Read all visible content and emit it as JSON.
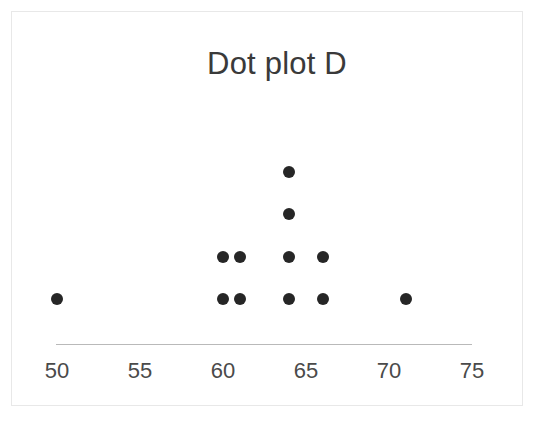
{
  "chart_data": {
    "type": "scatter",
    "plot_style": "dot-plot",
    "title": "Dot plot D",
    "xlabel": "",
    "ylabel": "",
    "xlim": [
      48.5,
      76.5
    ],
    "grid": false,
    "legend": null,
    "axis_line_color": "#b9b9b9",
    "dot_color": "#262626",
    "tick_labels": [
      "50",
      "55",
      "60",
      "65",
      "70",
      "75"
    ],
    "tick_values": [
      50,
      55,
      60,
      65,
      70,
      75
    ],
    "x": [
      50,
      60,
      61,
      64,
      66,
      71
    ],
    "counts": [
      1,
      2,
      2,
      4,
      2,
      1
    ],
    "total_dots": 12,
    "points": [
      {
        "value": 50,
        "count": 1
      },
      {
        "value": 60,
        "count": 2
      },
      {
        "value": 61,
        "count": 2
      },
      {
        "value": 64,
        "count": 4
      },
      {
        "value": 66,
        "count": 2
      },
      {
        "value": 71,
        "count": 1
      }
    ]
  },
  "figure": {
    "title": "Dot plot D",
    "background": "#ffffff",
    "border_color": "#e8e8e8"
  }
}
